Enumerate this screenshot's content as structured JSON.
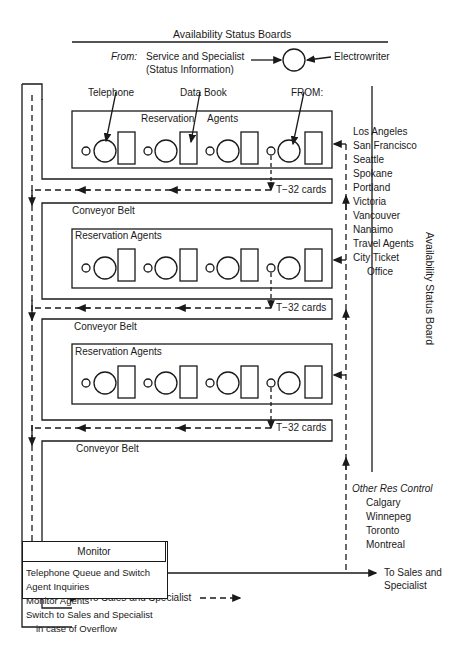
{
  "header": {
    "title": "Availability Status Boards",
    "from_label": "From:",
    "from_source_line1": "Service and Specialist",
    "from_source_line2": "(Status Information)",
    "electrowriter": "Electrowriter"
  },
  "callouts": {
    "telephone": "Telephone",
    "data_book": "Data Book",
    "from_caps": "FROM:"
  },
  "rows": [
    {
      "group_label": "Reservation Agents",
      "cards_label": "T−32 cards",
      "belt_label": "Conveyor Belt",
      "stations": 4
    },
    {
      "group_label": "Reservation Agents",
      "cards_label": "T−32 cards",
      "belt_label": "Conveyor Belt",
      "stations": 4
    },
    {
      "group_label": "Reservation Agents",
      "cards_label": "T−32 cards",
      "belt_label": "Conveyor Belt",
      "stations": 4
    }
  ],
  "row1_label_split": [
    "Reservation",
    "Agents"
  ],
  "sources": {
    "cities": [
      "Los Angeles",
      "San Francisco",
      "Seattle",
      "Spokane",
      "Portland",
      "Victoria",
      "Vancouver",
      "Nanaimo",
      "Travel Agents",
      "City Ticket"
    ],
    "cities_cont": "Office"
  },
  "side_board": "Availability Status Board",
  "other_res": {
    "title": "Other Res Control",
    "cities": [
      "Calgary",
      "Winnepeg",
      "Toronto",
      "Montreal"
    ]
  },
  "outputs": {
    "belt_to_sales": "To Sales and Specialist",
    "monitor_to_sales_line1": "To Sales and",
    "monitor_to_sales_line2": "Specialist"
  },
  "monitor": {
    "title": "Monitor",
    "items": [
      "Telephone Queue and Switch",
      "Agent Inquiries",
      "Monitor Agents",
      "Switch to Sales and Specialist"
    ],
    "items_cont": "in case of Overflow"
  },
  "colors": {
    "ink": "#1a1a1a",
    "background": "#ffffff"
  }
}
